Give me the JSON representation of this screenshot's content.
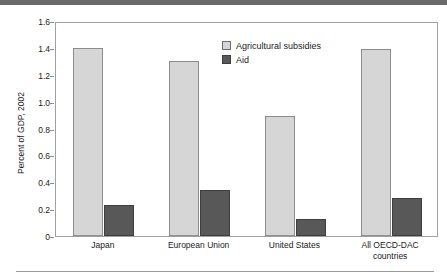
{
  "figure": {
    "title_band_text": "",
    "bottom_rule": true
  },
  "chart_data": {
    "type": "bar",
    "title": "",
    "subtitle": "",
    "xlabel": "",
    "ylabel": "Percent of GDP, 2002",
    "ylim": [
      0,
      1.6
    ],
    "ytick_step": 0.2,
    "ytick_labels": [
      "1.6",
      "1.4",
      "1.2",
      "1.0",
      "0.8",
      "0.6",
      "0.4",
      "0.2",
      "0"
    ],
    "ytick_values": [
      1.6,
      1.4,
      1.2,
      1.0,
      0.8,
      0.6,
      0.4,
      0.2,
      0
    ],
    "grid": false,
    "legend_position": "upper center",
    "categories": [
      "Japan",
      "European Union",
      "United States",
      "All OECD-DAC countries"
    ],
    "category_lines": [
      [
        "Japan"
      ],
      [
        "European Union"
      ],
      [
        "United States"
      ],
      [
        "All OECD-DAC",
        "countries"
      ]
    ],
    "series": [
      {
        "name": "Agricultural subsidies",
        "color": "#d6d6d6",
        "values": [
          1.4,
          1.3,
          0.89,
          1.39
        ]
      },
      {
        "name": "Aid",
        "color": "#585858",
        "values": [
          0.23,
          0.345,
          0.13,
          0.28
        ]
      }
    ],
    "annotations": []
  }
}
